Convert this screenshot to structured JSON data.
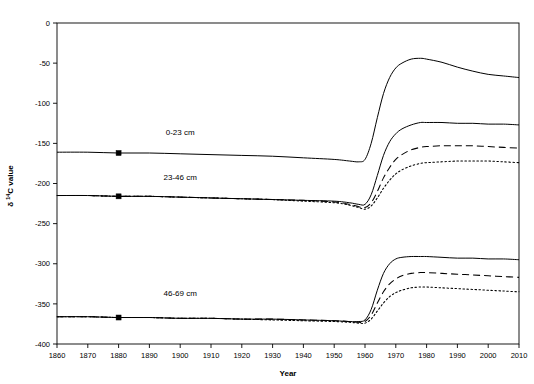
{
  "chart_data": {
    "type": "line",
    "title": "",
    "xlabel": "Year",
    "ylabel": "δ 14C value",
    "ylabel_prefix": "δ ",
    "ylabel_sup": "14",
    "ylabel_suffix": "C value",
    "xlim": [
      1860,
      2010
    ],
    "ylim": [
      -400,
      0
    ],
    "xticks": [
      1860,
      1870,
      1880,
      1890,
      1900,
      1910,
      1920,
      1930,
      1940,
      1950,
      1960,
      1970,
      1980,
      1990,
      2000,
      2010
    ],
    "xtick_labels": [
      "1860",
      "1870",
      "1880",
      "1890",
      "1900",
      "1910",
      "1920",
      "1930",
      "1940",
      "1950",
      "1960",
      "1970",
      "1980",
      "1990",
      "2000",
      "2010"
    ],
    "yticks": [
      0,
      -50,
      -100,
      -150,
      -200,
      -250,
      -300,
      -350,
      -400
    ],
    "ytick_labels": [
      "0",
      "-50",
      "-100",
      "-150",
      "-200",
      "-250",
      "-300",
      "-350",
      "-400"
    ],
    "grid": false,
    "legend": "inline-annotations",
    "annotations": [
      {
        "text": "0-23 cm",
        "x": 1900,
        "y": -140
      },
      {
        "text": "23-46 cm",
        "x": 1900,
        "y": -196
      },
      {
        "text": "46-69 cm",
        "x": 1900,
        "y": -340
      }
    ],
    "markers": [
      {
        "x": 1880,
        "y": -162,
        "shape": "square"
      },
      {
        "x": 1880,
        "y": -216,
        "shape": "square"
      },
      {
        "x": 1880,
        "y": -367,
        "shape": "square"
      }
    ],
    "x": [
      1860,
      1870,
      1880,
      1890,
      1900,
      1910,
      1920,
      1930,
      1940,
      1950,
      1955,
      1958,
      1960,
      1962,
      1964,
      1966,
      1968,
      1970,
      1972,
      1975,
      1978,
      1980,
      1985,
      1990,
      1995,
      2000,
      2005,
      2010
    ],
    "series": [
      {
        "name": "0-23 cm solid",
        "group": "0-23 cm",
        "style": "solid",
        "values": [
          -161,
          -161,
          -162,
          -162,
          -163,
          -164,
          -165,
          -166,
          -168,
          -170,
          -172,
          -173,
          -170,
          -150,
          -118,
          -88,
          -68,
          -56,
          -50,
          -45,
          -44,
          -45,
          -49,
          -55,
          -60,
          -64,
          -66,
          -68
        ]
      },
      {
        "name": "23-46 cm solid",
        "group": "23-46 cm",
        "style": "solid",
        "values": [
          -215,
          -215,
          -216,
          -216,
          -217,
          -218,
          -219,
          -220,
          -221,
          -222,
          -224,
          -226,
          -226,
          -214,
          -190,
          -165,
          -148,
          -138,
          -132,
          -127,
          -124,
          -124,
          -124,
          -125,
          -125,
          -126,
          -126,
          -127
        ]
      },
      {
        "name": "23-46 cm dashed",
        "group": "23-46 cm",
        "style": "dashed",
        "values": [
          -215,
          -215,
          -216,
          -216,
          -217,
          -218,
          -219,
          -220,
          -221,
          -223,
          -226,
          -229,
          -230,
          -224,
          -210,
          -193,
          -180,
          -170,
          -164,
          -158,
          -155,
          -154,
          -153,
          -153,
          -153,
          -154,
          -155,
          -156
        ]
      },
      {
        "name": "23-46 cm dotted",
        "group": "23-46 cm",
        "style": "dotted",
        "values": [
          -215,
          -215,
          -216,
          -216,
          -217,
          -218,
          -219,
          -220,
          -222,
          -224,
          -227,
          -230,
          -232,
          -228,
          -218,
          -206,
          -196,
          -188,
          -183,
          -178,
          -175,
          -174,
          -173,
          -172,
          -172,
          -172,
          -173,
          -174
        ]
      },
      {
        "name": "46-69 cm solid",
        "group": "46-69 cm",
        "style": "solid",
        "values": [
          -366,
          -366,
          -367,
          -367,
          -368,
          -368,
          -369,
          -369,
          -370,
          -371,
          -372,
          -372,
          -370,
          -357,
          -333,
          -312,
          -300,
          -294,
          -292,
          -291,
          -291,
          -291,
          -292,
          -293,
          -293,
          -294,
          -294,
          -295
        ]
      },
      {
        "name": "46-69 cm dashed",
        "group": "46-69 cm",
        "style": "dashed",
        "values": [
          -366,
          -366,
          -367,
          -367,
          -368,
          -368,
          -369,
          -369,
          -370,
          -371,
          -372,
          -373,
          -372,
          -364,
          -349,
          -335,
          -325,
          -319,
          -315,
          -312,
          -311,
          -311,
          -312,
          -313,
          -314,
          -315,
          -316,
          -317
        ]
      },
      {
        "name": "46-69 cm dotted",
        "group": "46-69 cm",
        "style": "dotted",
        "values": [
          -366,
          -366,
          -367,
          -367,
          -368,
          -368,
          -369,
          -370,
          -371,
          -372,
          -373,
          -374,
          -374,
          -369,
          -359,
          -349,
          -341,
          -336,
          -333,
          -330,
          -329,
          -329,
          -330,
          -331,
          -332,
          -333,
          -334,
          -335
        ]
      }
    ]
  }
}
